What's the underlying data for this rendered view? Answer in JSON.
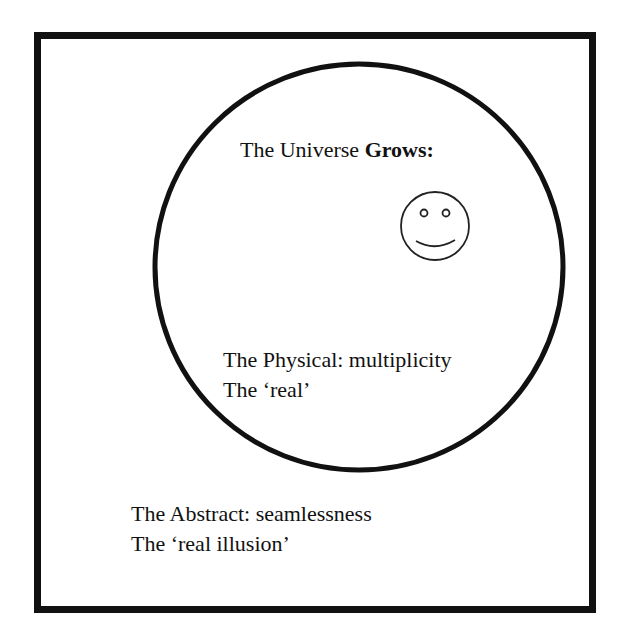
{
  "diagram": {
    "title": {
      "prefix": "The Universe ",
      "emphasis": "Grows:"
    },
    "inner_region": {
      "line1": "The Physical: multiplicity",
      "line2": "The ‘real’"
    },
    "outer_region": {
      "line1": "The Abstract: seamlessness",
      "line2": "The ‘real illusion’"
    },
    "icon": "smiley-face-icon",
    "colors": {
      "stroke": "#111111",
      "background": "#ffffff"
    }
  }
}
